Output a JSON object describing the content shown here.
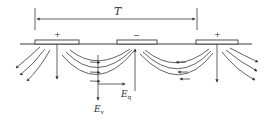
{
  "diagram": {
    "period_label": "T",
    "electrodes": [
      {
        "id": "left",
        "polarity": "+"
      },
      {
        "id": "middle",
        "polarity": "−"
      },
      {
        "id": "right",
        "polarity": "+"
      }
    ],
    "field_labels": {
      "vertical": {
        "base": "E",
        "sub": "v"
      },
      "horizontal": {
        "base": "E",
        "sub": "q"
      }
    },
    "colors": {
      "line": "#3a3a3a",
      "background": "#ffffff"
    }
  }
}
